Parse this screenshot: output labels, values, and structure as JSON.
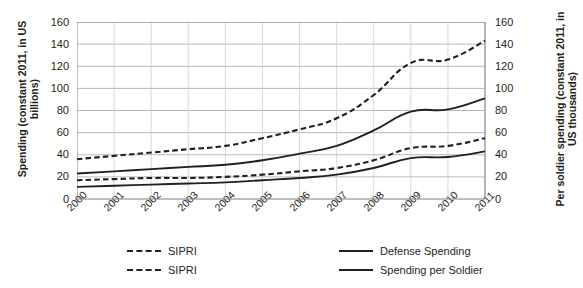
{
  "chart_data": {
    "type": "line",
    "title": "",
    "xlabel": "",
    "ylabel": "Spending (constant 2011, in US billions)",
    "y2label": "Per soldier spending (constant 2011, in US thousands)",
    "categories": [
      "2000",
      "2001",
      "2002",
      "2003",
      "2004",
      "2005",
      "2006",
      "2007",
      "2008",
      "2009",
      "2010",
      "2011"
    ],
    "ylim": [
      0,
      160
    ],
    "y2lim": [
      0,
      160
    ],
    "yticks": [
      0,
      20,
      40,
      60,
      80,
      100,
      120,
      140,
      160
    ],
    "y2ticks": [
      0,
      20,
      40,
      60,
      80,
      100,
      120,
      140,
      160
    ],
    "grid": true,
    "legend_position": "bottom",
    "series": [
      {
        "name": "SIPRI",
        "style": "dashed",
        "axis": "left",
        "color": "#231f20",
        "values": [
          36,
          39,
          42,
          45,
          48,
          55,
          63,
          73,
          94,
          123,
          126,
          143
        ]
      },
      {
        "name": "Defense Spending",
        "style": "solid",
        "axis": "left",
        "color": "#231f20",
        "values": [
          23,
          25,
          27,
          29,
          31,
          35,
          41,
          48,
          62,
          79,
          81,
          91
        ]
      },
      {
        "name": "SIPRI",
        "style": "dashed",
        "axis": "right",
        "color": "#231f20",
        "values": [
          17,
          18,
          19,
          19,
          20,
          22,
          25,
          28,
          35,
          46,
          48,
          55
        ]
      },
      {
        "name": "Spending per Soldier",
        "style": "solid",
        "axis": "right",
        "color": "#231f20",
        "values": [
          11,
          12,
          13,
          14,
          15,
          17,
          19,
          22,
          28,
          37,
          38,
          43
        ]
      }
    ]
  },
  "y_axis_left": {
    "title": "Spending (constant 2011, in US billions)",
    "ticks": [
      "160",
      "140",
      "120",
      "100",
      "80",
      "60",
      "40",
      "20",
      "0"
    ]
  },
  "y_axis_right": {
    "title": "Per soldier spending (constant 2011, in US thousands)",
    "ticks": [
      "160",
      "140",
      "120",
      "100",
      "80",
      "60",
      "40",
      "20",
      "0"
    ]
  },
  "x_axis": {
    "ticks": [
      "2000",
      "2001",
      "2002",
      "2003",
      "2004",
      "2005",
      "2006",
      "2007",
      "2008",
      "2009",
      "2010",
      "2011"
    ]
  },
  "legend": {
    "items": [
      {
        "label": "SIPRI",
        "style": "dashed"
      },
      {
        "label": "SIPRI",
        "style": "dashed"
      },
      {
        "label": "Defense Spending",
        "style": "solid"
      },
      {
        "label": "Spending per Soldier",
        "style": "solid"
      }
    ]
  }
}
